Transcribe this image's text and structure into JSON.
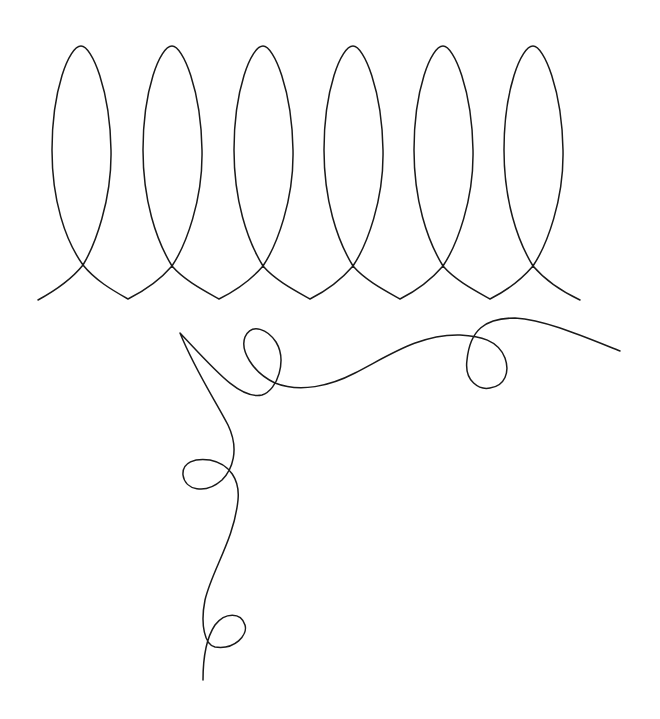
{
  "canvas": {
    "width": 660,
    "height": 719,
    "background": "#ffffff"
  },
  "stroke": {
    "color": "#1a1a1a",
    "width": 1.5
  },
  "drawings": [
    {
      "name": "looped-coil",
      "loop_count": 6
    },
    {
      "name": "curly-line",
      "loop_count": 4
    }
  ]
}
